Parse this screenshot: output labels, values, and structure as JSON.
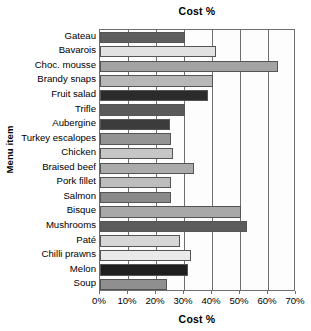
{
  "chart_data": {
    "type": "bar",
    "orientation": "horizontal",
    "title": "Cost %",
    "xlabel": "Cost %",
    "ylabel": "Menu item",
    "xlim": [
      0,
      70
    ],
    "xtick_step": 10,
    "grid": true,
    "legend": "none",
    "categories": [
      "Gateau",
      "Bavarois",
      "Choc. mousse",
      "Brandy snaps",
      "Fruit salad",
      "Trifle",
      "Aubergine",
      "Turkey escalopes",
      "Chicken",
      "Braised beef",
      "Pork fillet",
      "Salmon",
      "Bisque",
      "Mushrooms",
      "Paté",
      "Chilli prawns",
      "Melon",
      "Soup"
    ],
    "values": [
      30.5,
      41.5,
      63.5,
      40.5,
      38.5,
      30.5,
      25.0,
      25.5,
      26.0,
      33.5,
      25.5,
      25.5,
      50.5,
      52.5,
      28.5,
      32.5,
      31.5,
      24.0
    ],
    "tick_labels": [
      "0%",
      "10%",
      "20%",
      "30%",
      "40%",
      "50%",
      "60%",
      "70%"
    ],
    "tick_values": [
      0,
      10,
      20,
      30,
      40,
      50,
      60,
      70
    ],
    "bar_colors": [
      "#5e5e5e",
      "#e2e2e2",
      "#a3a3a3",
      "#b7b7b7",
      "#2b2b2b",
      "#5a5a5a",
      "#3c3c3c",
      "#949494",
      "#c6c6c6",
      "#ababab",
      "#bdbdbd",
      "#8a8a8a",
      "#a8a8a8",
      "#5c5c5c",
      "#d6d6d6",
      "#eaeaea",
      "#1f1f1f",
      "#8f8f8f"
    ]
  }
}
